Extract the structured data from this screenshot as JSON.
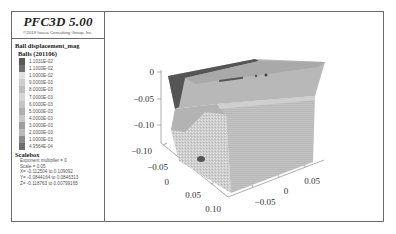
{
  "legend": {
    "app_title": "PFC3D 5.00",
    "copyright": "©2019 Itasca Consulting Group, Inc.",
    "plot_item_name": "Ball displacement_mag",
    "balls_label": "Balls (201106)",
    "color_scale": [
      {
        "label": "1.1031E-02",
        "color": "#5a5a5a"
      },
      {
        "label": "1.1000E-02",
        "color": "#707070"
      },
      {
        "label": "1.0000E-02",
        "color": "#e0e0e0"
      },
      {
        "label": "9.0000E-03",
        "color": "#cfcfcf"
      },
      {
        "label": "8.0000E-03",
        "color": "#bdbdbd"
      },
      {
        "label": "7.0000E-03",
        "color": "#d6d6d6"
      },
      {
        "label": "6.0000E-03",
        "color": "#c4c4c4"
      },
      {
        "label": "5.0000E-03",
        "color": "#b0b0b0"
      },
      {
        "label": "4.0000E-03",
        "color": "#c9c9c9"
      },
      {
        "label": "3.0000E-03",
        "color": "#9e9e9e"
      },
      {
        "label": "2.0000E-03",
        "color": "#bababa"
      },
      {
        "label": "1.0000E-03",
        "color": "#8a8a8a"
      },
      {
        "label": "4.9564E-04",
        "color": "#6e6e6e"
      }
    ],
    "scalebox": {
      "title": "Scalebox",
      "lines": [
        "Exponent multiplier = 0",
        "Scale = 0.05",
        "X= -0.112504 to 0.109092",
        "Y= -0.0844164 to 0.0846313",
        "Z= -0.118763 to 0.00799165"
      ]
    }
  },
  "viewport": {
    "z_axis_ticks": [
      "0",
      "−0.05",
      "−0.10"
    ],
    "x_axis_ticks": [
      "−0.10",
      "−0.05",
      "0",
      "0.05",
      "0.10"
    ],
    "y_axis_ticks": [
      "−0.05",
      "0",
      "0.05"
    ],
    "colors": {
      "top_face": "#b9b9b9",
      "top_back_dark": "#505050",
      "front_face": "#c8c8c8",
      "right_face": "#bcbcbc",
      "speckle": "#d8d8d8",
      "axis": "#888888"
    }
  }
}
